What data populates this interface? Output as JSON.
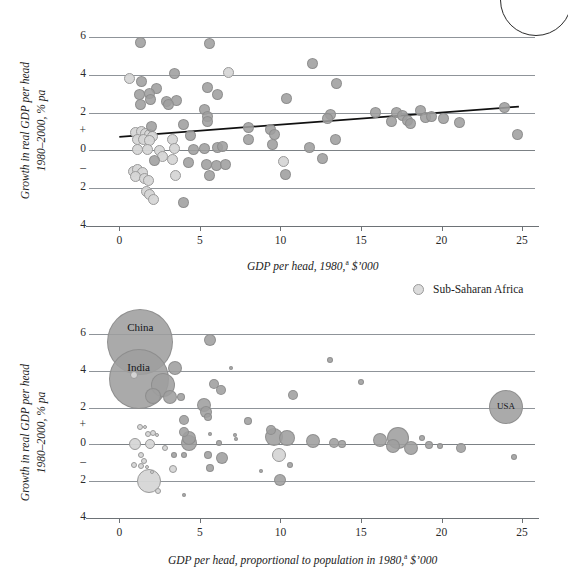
{
  "figure": {
    "background": "#ffffff",
    "bubble_color": "#9e9e9e",
    "ssa_color": "#dcdcdc",
    "grid_color": "#8f9499",
    "trend_color": "#111111"
  },
  "legend": {
    "label": "Sub-Saharan Africa",
    "swatch_name": "ssa-circle-swatch"
  },
  "chart_data": [
    {
      "type": "scatter",
      "id": "top",
      "title": "",
      "xlabel": "GDP per head, 1980,<sup>a</sup> $'000",
      "xlabel_text": "GDP per head, 1980,a $'000",
      "ylabel_line1": "Growth in real GDP per head",
      "ylabel_line2": "1980–2000, % pa",
      "xlim": [
        -1.2,
        25.8
      ],
      "ylim": [
        -4.6,
        6.6
      ],
      "xticks": [
        0,
        5,
        10,
        15,
        20,
        25
      ],
      "yticks": [
        "6",
        "4",
        "2",
        "+",
        "0",
        "–",
        "2",
        "4"
      ],
      "ytick_values": [
        6,
        4,
        2,
        1,
        0,
        -1,
        -2,
        -4
      ],
      "gridlines": [
        6,
        4,
        2,
        0,
        -2,
        -4
      ],
      "grid": true,
      "legend_position": "below-right",
      "trendline": {
        "x0": 0.0,
        "y0": 0.72,
        "x1": 24.8,
        "y1": 2.32
      },
      "points": [
        {
          "x": 1.3,
          "y": 5.75,
          "ssa": false
        },
        {
          "x": 5.6,
          "y": 5.65,
          "ssa": false
        },
        {
          "x": 3.4,
          "y": 4.1,
          "ssa": false
        },
        {
          "x": 6.8,
          "y": 4.15,
          "ssa": true
        },
        {
          "x": 0.6,
          "y": 3.8,
          "ssa": true
        },
        {
          "x": 1.4,
          "y": 3.65,
          "ssa": false
        },
        {
          "x": 2.3,
          "y": 3.3,
          "ssa": false
        },
        {
          "x": 5.5,
          "y": 3.35,
          "ssa": false
        },
        {
          "x": 6.1,
          "y": 2.95,
          "ssa": false
        },
        {
          "x": 1.25,
          "y": 2.95,
          "ssa": false
        },
        {
          "x": 1.85,
          "y": 3.0,
          "ssa": false
        },
        {
          "x": 1.95,
          "y": 2.7,
          "ssa": false
        },
        {
          "x": 1.3,
          "y": 2.45,
          "ssa": false
        },
        {
          "x": 2.95,
          "y": 2.6,
          "ssa": false
        },
        {
          "x": 3.55,
          "y": 2.65,
          "ssa": false
        },
        {
          "x": 10.4,
          "y": 2.75,
          "ssa": false
        },
        {
          "x": 12.0,
          "y": 4.6,
          "ssa": false
        },
        {
          "x": 13.5,
          "y": 3.55,
          "ssa": false
        },
        {
          "x": 5.3,
          "y": 2.15,
          "ssa": false
        },
        {
          "x": 5.45,
          "y": 1.8,
          "ssa": false
        },
        {
          "x": 5.5,
          "y": 1.55,
          "ssa": false
        },
        {
          "x": 4.0,
          "y": 1.35,
          "ssa": false
        },
        {
          "x": 8.0,
          "y": 1.2,
          "ssa": false
        },
        {
          "x": 9.4,
          "y": 1.1,
          "ssa": false
        },
        {
          "x": 9.6,
          "y": 0.85,
          "ssa": false
        },
        {
          "x": 15.9,
          "y": 2.0,
          "ssa": false
        },
        {
          "x": 16.9,
          "y": 1.55,
          "ssa": false
        },
        {
          "x": 17.2,
          "y": 2.0,
          "ssa": false
        },
        {
          "x": 17.6,
          "y": 1.85,
          "ssa": false
        },
        {
          "x": 17.9,
          "y": 1.6,
          "ssa": false
        },
        {
          "x": 18.1,
          "y": 1.4,
          "ssa": false
        },
        {
          "x": 18.7,
          "y": 2.1,
          "ssa": false
        },
        {
          "x": 19.0,
          "y": 1.75,
          "ssa": false
        },
        {
          "x": 19.4,
          "y": 1.8,
          "ssa": false
        },
        {
          "x": 20.1,
          "y": 1.7,
          "ssa": false
        },
        {
          "x": 21.1,
          "y": 1.5,
          "ssa": false
        },
        {
          "x": 23.9,
          "y": 2.25,
          "ssa": false
        },
        {
          "x": 24.7,
          "y": 0.85,
          "ssa": false
        },
        {
          "x": 13.1,
          "y": 1.9,
          "ssa": false
        },
        {
          "x": 12.9,
          "y": 1.7,
          "ssa": false
        },
        {
          "x": 13.4,
          "y": 0.6,
          "ssa": false
        },
        {
          "x": 11.8,
          "y": 0.15,
          "ssa": false
        },
        {
          "x": 12.6,
          "y": -0.45,
          "ssa": false
        },
        {
          "x": 1.0,
          "y": 0.95,
          "ssa": true
        },
        {
          "x": 1.35,
          "y": 1.0,
          "ssa": true
        },
        {
          "x": 1.6,
          "y": 0.9,
          "ssa": true
        },
        {
          "x": 1.85,
          "y": 0.85,
          "ssa": true
        },
        {
          "x": 2.05,
          "y": 0.75,
          "ssa": true
        },
        {
          "x": 1.15,
          "y": 0.6,
          "ssa": true
        },
        {
          "x": 1.5,
          "y": 0.55,
          "ssa": true
        },
        {
          "x": 1.9,
          "y": 0.5,
          "ssa": true
        },
        {
          "x": 1.1,
          "y": 0.05,
          "ssa": true
        },
        {
          "x": 1.75,
          "y": 0.05,
          "ssa": true
        },
        {
          "x": 2.5,
          "y": 0.0,
          "ssa": true
        },
        {
          "x": 3.3,
          "y": 0.55,
          "ssa": true
        },
        {
          "x": 3.4,
          "y": 0.1,
          "ssa": true
        },
        {
          "x": 2.7,
          "y": -0.35,
          "ssa": true
        },
        {
          "x": 3.3,
          "y": -0.5,
          "ssa": true
        },
        {
          "x": 3.5,
          "y": -1.35,
          "ssa": true
        },
        {
          "x": 0.85,
          "y": -1.1,
          "ssa": true
        },
        {
          "x": 1.15,
          "y": -1.0,
          "ssa": true
        },
        {
          "x": 1.45,
          "y": -1.15,
          "ssa": true
        },
        {
          "x": 1.0,
          "y": -1.4,
          "ssa": true
        },
        {
          "x": 1.55,
          "y": -1.5,
          "ssa": true
        },
        {
          "x": 1.8,
          "y": -1.6,
          "ssa": true
        },
        {
          "x": 1.7,
          "y": -2.2,
          "ssa": true
        },
        {
          "x": 1.9,
          "y": -2.35,
          "ssa": true
        },
        {
          "x": 2.1,
          "y": -2.6,
          "ssa": true
        },
        {
          "x": 4.0,
          "y": -2.75,
          "ssa": false
        },
        {
          "x": 4.3,
          "y": -0.65,
          "ssa": false
        },
        {
          "x": 5.4,
          "y": -0.75,
          "ssa": false
        },
        {
          "x": 6.0,
          "y": -0.8,
          "ssa": false
        },
        {
          "x": 6.6,
          "y": -0.75,
          "ssa": false
        },
        {
          "x": 5.6,
          "y": -1.35,
          "ssa": false
        },
        {
          "x": 4.6,
          "y": 0.05,
          "ssa": false
        },
        {
          "x": 5.3,
          "y": 0.1,
          "ssa": false
        },
        {
          "x": 6.1,
          "y": 0.15,
          "ssa": false
        },
        {
          "x": 6.4,
          "y": 0.2,
          "ssa": false
        },
        {
          "x": 8.0,
          "y": 0.6,
          "ssa": false
        },
        {
          "x": 9.5,
          "y": 0.3,
          "ssa": false
        },
        {
          "x": 10.2,
          "y": -0.6,
          "ssa": true
        },
        {
          "x": 10.3,
          "y": -1.3,
          "ssa": false
        },
        {
          "x": 4.4,
          "y": 0.8,
          "ssa": false
        },
        {
          "x": 2.0,
          "y": 1.25,
          "ssa": false
        },
        {
          "x": 2.2,
          "y": -0.55,
          "ssa": false
        },
        {
          "x": 3.05,
          "y": 2.45,
          "ssa": false
        }
      ]
    },
    {
      "type": "bubble",
      "id": "bottom",
      "title": "",
      "xlabel": "GDP per head, proportional to population in 1980,<sup>a</sup> $'000",
      "xlabel_text": "GDP per head, proportional to population in 1980,a $'000",
      "ylabel_line1": "Growth in real GDP per head",
      "ylabel_line2": "1980–2000, % pa",
      "xlim": [
        -1.2,
        25.8
      ],
      "ylim": [
        -4.6,
        6.6
      ],
      "xticks": [
        0,
        5,
        10,
        15,
        20,
        25
      ],
      "yticks": [
        "6",
        "4",
        "2",
        "+",
        "0",
        "–",
        "2",
        "4"
      ],
      "gridlines": [
        6,
        4,
        2,
        0,
        -2,
        -4
      ],
      "grid": true,
      "annotations": [
        {
          "text": "China",
          "x": 1.3,
          "y": 5.65
        },
        {
          "text": "India",
          "x": 1.2,
          "y": 3.7
        },
        {
          "text": "USA",
          "x": 24.0,
          "y": 2.05
        }
      ],
      "bubbles": [
        {
          "x": 1.3,
          "y": 5.55,
          "r": 33,
          "ssa": false,
          "label": "China"
        },
        {
          "x": 1.2,
          "y": 3.55,
          "r": 30,
          "ssa": false,
          "label": "India"
        },
        {
          "x": 24.0,
          "y": 2.05,
          "r": 17,
          "ssa": false,
          "label": "USA"
        },
        {
          "x": 5.6,
          "y": 5.7,
          "r": 6,
          "ssa": false
        },
        {
          "x": 13.1,
          "y": 4.6,
          "r": 3,
          "ssa": false
        },
        {
          "x": 3.45,
          "y": 4.15,
          "r": 7,
          "ssa": false
        },
        {
          "x": 0.9,
          "y": 3.8,
          "r": 4,
          "ssa": true
        },
        {
          "x": 6.9,
          "y": 4.15,
          "r": 2,
          "ssa": false
        },
        {
          "x": 15.0,
          "y": 3.4,
          "r": 3,
          "ssa": false
        },
        {
          "x": 2.7,
          "y": 3.25,
          "r": 12,
          "ssa": false
        },
        {
          "x": 5.9,
          "y": 3.3,
          "r": 5,
          "ssa": false
        },
        {
          "x": 6.3,
          "y": 2.95,
          "r": 5,
          "ssa": false
        },
        {
          "x": 2.1,
          "y": 2.65,
          "r": 8,
          "ssa": false
        },
        {
          "x": 3.15,
          "y": 2.6,
          "r": 7,
          "ssa": false
        },
        {
          "x": 3.8,
          "y": 2.6,
          "r": 4,
          "ssa": false
        },
        {
          "x": 10.8,
          "y": 2.7,
          "r": 5,
          "ssa": false
        },
        {
          "x": 5.25,
          "y": 2.15,
          "r": 7,
          "ssa": false
        },
        {
          "x": 5.4,
          "y": 1.75,
          "r": 6,
          "ssa": false
        },
        {
          "x": 5.5,
          "y": 1.5,
          "r": 4,
          "ssa": false
        },
        {
          "x": 4.0,
          "y": 1.35,
          "r": 5,
          "ssa": false
        },
        {
          "x": 8.0,
          "y": 1.25,
          "r": 4,
          "ssa": false
        },
        {
          "x": 1.3,
          "y": 0.95,
          "r": 3,
          "ssa": true
        },
        {
          "x": 1.6,
          "y": 0.95,
          "r": 2,
          "ssa": true
        },
        {
          "x": 1.75,
          "y": 0.55,
          "r": 3,
          "ssa": true
        },
        {
          "x": 2.1,
          "y": 0.6,
          "r": 3,
          "ssa": true
        },
        {
          "x": 2.35,
          "y": 0.5,
          "r": 2,
          "ssa": true
        },
        {
          "x": 4.0,
          "y": 0.7,
          "r": 5,
          "ssa": false
        },
        {
          "x": 4.3,
          "y": 0.35,
          "r": 7,
          "ssa": false
        },
        {
          "x": 5.6,
          "y": 0.55,
          "r": 2,
          "ssa": false
        },
        {
          "x": 7.2,
          "y": 0.5,
          "r": 2,
          "ssa": false
        },
        {
          "x": 7.25,
          "y": 0.3,
          "r": 2,
          "ssa": false
        },
        {
          "x": 9.4,
          "y": 0.8,
          "r": 5,
          "ssa": false
        },
        {
          "x": 9.6,
          "y": 0.4,
          "r": 9,
          "ssa": false
        },
        {
          "x": 10.4,
          "y": 0.35,
          "r": 8,
          "ssa": false
        },
        {
          "x": 12.0,
          "y": 0.2,
          "r": 7,
          "ssa": false
        },
        {
          "x": 1.0,
          "y": 0.0,
          "r": 6,
          "ssa": true
        },
        {
          "x": 1.9,
          "y": 0.0,
          "r": 5,
          "ssa": true
        },
        {
          "x": 2.85,
          "y": -0.2,
          "r": 3,
          "ssa": true
        },
        {
          "x": 4.3,
          "y": 0.05,
          "r": 8,
          "ssa": false
        },
        {
          "x": 6.2,
          "y": 0.1,
          "r": 3,
          "ssa": false
        },
        {
          "x": 13.3,
          "y": 0.05,
          "r": 5,
          "ssa": false
        },
        {
          "x": 13.8,
          "y": 0.0,
          "r": 4,
          "ssa": false
        },
        {
          "x": 16.2,
          "y": 0.25,
          "r": 7,
          "ssa": false
        },
        {
          "x": 17.3,
          "y": 0.35,
          "r": 11,
          "ssa": false
        },
        {
          "x": 17.0,
          "y": -0.1,
          "r": 7,
          "ssa": false
        },
        {
          "x": 18.1,
          "y": -0.2,
          "r": 7,
          "ssa": false
        },
        {
          "x": 18.8,
          "y": 0.35,
          "r": 3,
          "ssa": false
        },
        {
          "x": 19.2,
          "y": -0.05,
          "r": 4,
          "ssa": false
        },
        {
          "x": 19.9,
          "y": -0.1,
          "r": 3,
          "ssa": false
        },
        {
          "x": 21.2,
          "y": -0.2,
          "r": 5,
          "ssa": false
        },
        {
          "x": 1.35,
          "y": -0.55,
          "r": 3,
          "ssa": true
        },
        {
          "x": 1.5,
          "y": -0.9,
          "r": 3,
          "ssa": true
        },
        {
          "x": 0.9,
          "y": -1.1,
          "r": 3,
          "ssa": true
        },
        {
          "x": 1.35,
          "y": -1.15,
          "r": 3,
          "ssa": true
        },
        {
          "x": 1.7,
          "y": -1.25,
          "r": 2,
          "ssa": true
        },
        {
          "x": 2.0,
          "y": -1.5,
          "r": 2,
          "ssa": true
        },
        {
          "x": 3.3,
          "y": -1.35,
          "r": 4,
          "ssa": true
        },
        {
          "x": 3.4,
          "y": -0.55,
          "r": 3,
          "ssa": false
        },
        {
          "x": 4.0,
          "y": -0.6,
          "r": 3,
          "ssa": false
        },
        {
          "x": 5.5,
          "y": -0.6,
          "r": 4,
          "ssa": false
        },
        {
          "x": 6.4,
          "y": -0.75,
          "r": 6,
          "ssa": false
        },
        {
          "x": 5.6,
          "y": -1.3,
          "r": 4,
          "ssa": false
        },
        {
          "x": 9.9,
          "y": -0.55,
          "r": 7,
          "ssa": true
        },
        {
          "x": 10.6,
          "y": -1.1,
          "r": 3,
          "ssa": false
        },
        {
          "x": 24.5,
          "y": -0.7,
          "r": 3,
          "ssa": false
        },
        {
          "x": 1.85,
          "y": -2.0,
          "r": 12,
          "ssa": true
        },
        {
          "x": 2.4,
          "y": -2.55,
          "r": 3,
          "ssa": true
        },
        {
          "x": 4.0,
          "y": -2.75,
          "r": 2,
          "ssa": false
        },
        {
          "x": 10.0,
          "y": -1.95,
          "r": 6,
          "ssa": false
        },
        {
          "x": 8.8,
          "y": -1.45,
          "r": 2,
          "ssa": false
        }
      ]
    }
  ]
}
